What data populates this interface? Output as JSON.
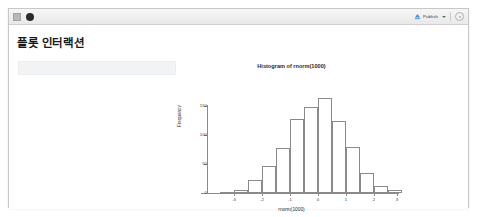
{
  "window": {
    "toolbar": {
      "run_icon": "run-document-icon",
      "stop_icon": "stop-circle-icon",
      "publish_label": "Publish",
      "publish_icon": "publish-icon",
      "publish_caret_icon": "chevron-down-icon",
      "settings_icon": "gear-icon"
    }
  },
  "content": {
    "title": "플롯 인터랙션",
    "placeholder_value": ""
  },
  "chart_data": {
    "type": "bar",
    "title": "Histogram of rnorm(1000)",
    "xlabel": "rnorm(1000)",
    "ylabel": "Frequency",
    "xlim": [
      -3.6,
      3.4
    ],
    "ylim": [
      0,
      165
    ],
    "grid": false,
    "legend": null,
    "xticks": [
      "-3",
      "-2",
      "-1",
      "0",
      "1",
      "2",
      "3"
    ],
    "xtick_values": [
      -3,
      -2,
      -1,
      0,
      1,
      2,
      3
    ],
    "yticks": [
      "0",
      "50",
      "100",
      "150"
    ],
    "ytick_values": [
      0,
      50,
      100,
      150
    ],
    "bin_width": 0.5,
    "bin_starts": [
      -3.5,
      -3.0,
      -2.5,
      -2.0,
      -1.5,
      -1.0,
      -0.5,
      0.0,
      0.5,
      1.0,
      1.5,
      2.0,
      2.5
    ],
    "categories": [
      "-3.5 to -3.0",
      "-3.0 to -2.5",
      "-2.5 to -2.0",
      "-2.0 to -1.5",
      "-1.5 to -1.0",
      "-1.0 to -0.5",
      "-0.5 to 0.0",
      "0.0 to 0.5",
      "0.5 to 1.0",
      "1.0 to 1.5",
      "1.5 to 2.0",
      "2.0 to 2.5",
      "2.5 to 3.0"
    ],
    "values": [
      2,
      6,
      22,
      46,
      78,
      128,
      148,
      163,
      125,
      80,
      35,
      12,
      5
    ]
  }
}
